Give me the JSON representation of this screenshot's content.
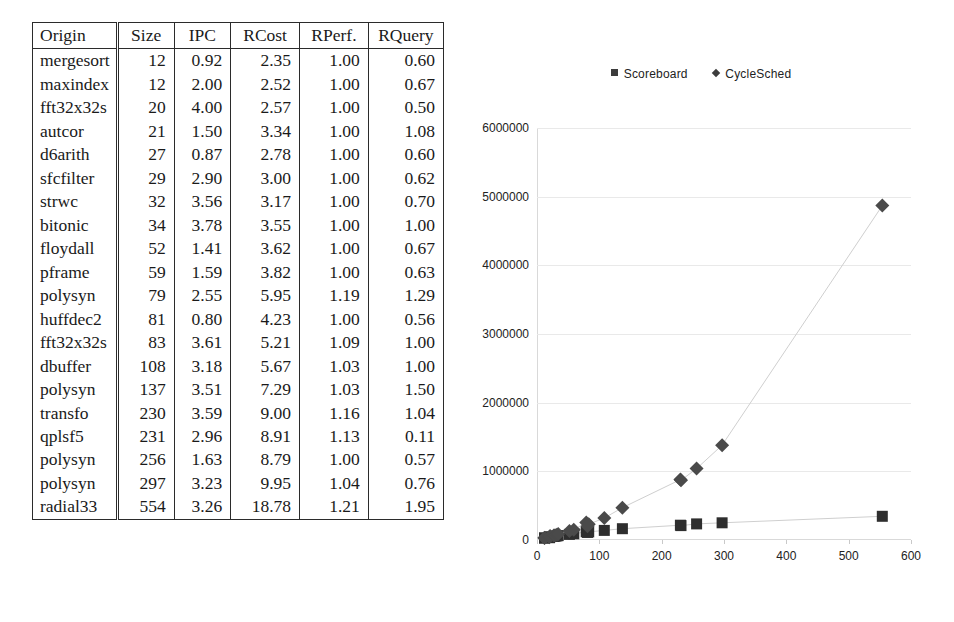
{
  "table": {
    "columns": [
      "Origin",
      "Size",
      "IPC",
      "RCost",
      "RPerf.",
      "RQuery"
    ],
    "rows": [
      {
        "origin": "mergesort",
        "size": "12",
        "ipc": "0.92",
        "rcost": "2.35",
        "rperf": "1.00",
        "rquery": "0.60"
      },
      {
        "origin": "maxindex",
        "size": "12",
        "ipc": "2.00",
        "rcost": "2.52",
        "rperf": "1.00",
        "rquery": "0.67"
      },
      {
        "origin": "fft32x32s",
        "size": "20",
        "ipc": "4.00",
        "rcost": "2.57",
        "rperf": "1.00",
        "rquery": "0.50"
      },
      {
        "origin": "autcor",
        "size": "21",
        "ipc": "1.50",
        "rcost": "3.34",
        "rperf": "1.00",
        "rquery": "1.08"
      },
      {
        "origin": "d6arith",
        "size": "27",
        "ipc": "0.87",
        "rcost": "2.78",
        "rperf": "1.00",
        "rquery": "0.60"
      },
      {
        "origin": "sfcfilter",
        "size": "29",
        "ipc": "2.90",
        "rcost": "3.00",
        "rperf": "1.00",
        "rquery": "0.62"
      },
      {
        "origin": "strwc",
        "size": "32",
        "ipc": "3.56",
        "rcost": "3.17",
        "rperf": "1.00",
        "rquery": "0.70"
      },
      {
        "origin": "bitonic",
        "size": "34",
        "ipc": "3.78",
        "rcost": "3.55",
        "rperf": "1.00",
        "rquery": "1.00"
      },
      {
        "origin": "floydall",
        "size": "52",
        "ipc": "1.41",
        "rcost": "3.62",
        "rperf": "1.00",
        "rquery": "0.67"
      },
      {
        "origin": "pframe",
        "size": "59",
        "ipc": "1.59",
        "rcost": "3.82",
        "rperf": "1.00",
        "rquery": "0.63"
      },
      {
        "origin": "polysyn",
        "size": "79",
        "ipc": "2.55",
        "rcost": "5.95",
        "rperf": "1.19",
        "rquery": "1.29"
      },
      {
        "origin": "huffdec2",
        "size": "81",
        "ipc": "0.80",
        "rcost": "4.23",
        "rperf": "1.00",
        "rquery": "0.56"
      },
      {
        "origin": "fft32x32s",
        "size": "83",
        "ipc": "3.61",
        "rcost": "5.21",
        "rperf": "1.09",
        "rquery": "1.00"
      },
      {
        "origin": "dbuffer",
        "size": "108",
        "ipc": "3.18",
        "rcost": "5.67",
        "rperf": "1.03",
        "rquery": "1.00"
      },
      {
        "origin": "polysyn",
        "size": "137",
        "ipc": "3.51",
        "rcost": "7.29",
        "rperf": "1.03",
        "rquery": "1.50"
      },
      {
        "origin": "transfo",
        "size": "230",
        "ipc": "3.59",
        "rcost": "9.00",
        "rperf": "1.16",
        "rquery": "1.04"
      },
      {
        "origin": "qplsf5",
        "size": "231",
        "ipc": "2.96",
        "rcost": "8.91",
        "rperf": "1.13",
        "rquery": "0.11"
      },
      {
        "origin": "polysyn",
        "size": "256",
        "ipc": "1.63",
        "rcost": "8.79",
        "rperf": "1.00",
        "rquery": "0.57"
      },
      {
        "origin": "polysyn",
        "size": "297",
        "ipc": "3.23",
        "rcost": "9.95",
        "rperf": "1.04",
        "rquery": "0.76"
      },
      {
        "origin": "radial33",
        "size": "554",
        "ipc": "3.26",
        "rcost": "18.78",
        "rperf": "1.21",
        "rquery": "1.95"
      }
    ]
  },
  "chart_data": {
    "type": "scatter",
    "title": "",
    "xlabel": "",
    "ylabel": "",
    "xlim": [
      0,
      600
    ],
    "ylim": [
      0,
      6000000
    ],
    "xticks": [
      "0",
      "100",
      "200",
      "300",
      "400",
      "500",
      "600"
    ],
    "yticks": [
      "0",
      "1000000",
      "2000000",
      "3000000",
      "4000000",
      "5000000",
      "6000000"
    ],
    "xtick_values": [
      0,
      100,
      200,
      300,
      400,
      500,
      600
    ],
    "ytick_values": [
      0,
      1000000,
      2000000,
      3000000,
      4000000,
      5000000,
      6000000
    ],
    "grid": true,
    "legend_position": "top",
    "marker_color_scoreboard": "#2e2e2e",
    "marker_color_cyclesched": "#4a4a4a",
    "connector_color": "#cfcfcf",
    "series": [
      {
        "name": "Scoreboard",
        "marker": "square",
        "x": [
          12,
          12,
          20,
          21,
          27,
          29,
          32,
          34,
          52,
          59,
          79,
          81,
          83,
          108,
          137,
          230,
          231,
          256,
          297,
          554
        ],
        "y": [
          28000,
          30000,
          34000,
          48000,
          52000,
          56000,
          60000,
          64000,
          82000,
          90000,
          120000,
          110000,
          118000,
          140000,
          165000,
          215000,
          210000,
          235000,
          250000,
          345000
        ]
      },
      {
        "name": "CycleSched",
        "marker": "diamond",
        "x": [
          12,
          12,
          20,
          21,
          27,
          29,
          32,
          34,
          52,
          59,
          79,
          81,
          83,
          108,
          137,
          230,
          231,
          256,
          297,
          554
        ],
        "y": [
          30000,
          34000,
          40000,
          58000,
          64000,
          70000,
          78000,
          88000,
          130000,
          150000,
          255000,
          200000,
          230000,
          320000,
          470000,
          880000,
          870000,
          1040000,
          1380000,
          4870000
        ]
      }
    ]
  }
}
